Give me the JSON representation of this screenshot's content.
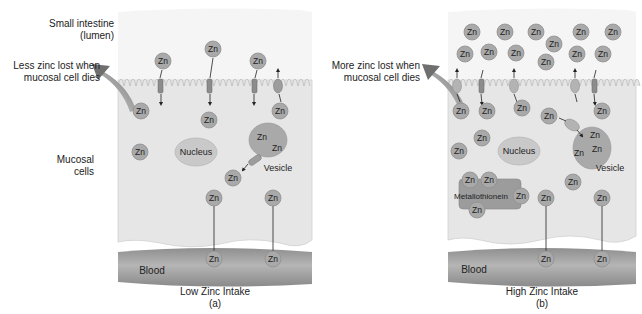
{
  "panels": [
    {
      "id": "a",
      "title": "Low Zinc Intake",
      "letter": "(a)",
      "loss_note_line1": "Less zinc lost when",
      "loss_note_line2": "mucosal cell dies",
      "labels": {
        "lumen_line1": "Small intestine",
        "lumen_line2": "(lumen)",
        "mucosal_line1": "Mucosal",
        "mucosal_line2": "cells",
        "nucleus": "Nucleus",
        "vesicle": "Vesicle",
        "blood": "Blood"
      }
    },
    {
      "id": "b",
      "title": "High Zinc Intake",
      "letter": "(b)",
      "loss_note_line1": "More zinc lost when",
      "loss_note_line2": "mucosal cell dies",
      "labels": {
        "nucleus": "Nucleus",
        "vesicle": "Vesicle",
        "metallothionein": "Metallothionein",
        "blood": "Blood"
      }
    }
  ],
  "zinc_symbol": "Zn",
  "colors": {
    "lumen": "#f4f4f4",
    "cell": "#e6e6e6",
    "cell_border": "#cfcfcf",
    "zn_fill": "#a9a9a9",
    "zn_stroke": "#8a8a8a",
    "blood": "#9c9c9c",
    "nucleus": "#c9c9c9",
    "vesicle": "#a8a8a8",
    "metallothionein": "#9a9a9a",
    "arrow_loss": "#777777"
  }
}
